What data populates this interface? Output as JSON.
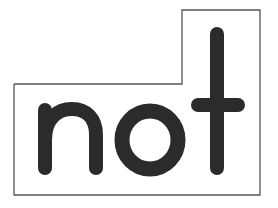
{
  "sign": {
    "text": "not",
    "colors": {
      "background": "#ffffff",
      "border": "#555555",
      "letters": "#2b2b2b"
    }
  }
}
